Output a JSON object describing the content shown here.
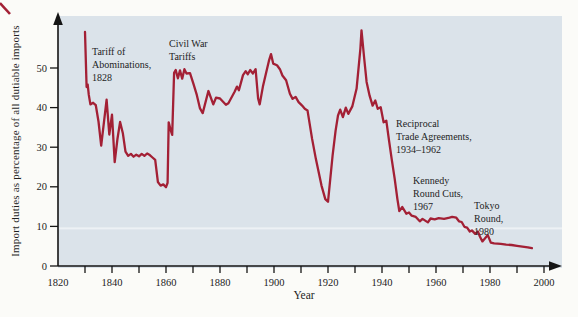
{
  "figure": {
    "x_axis_title": "Year",
    "y_axis_title": "Import duties as percentage of all dutiable imports"
  },
  "chart_data": {
    "type": "line",
    "title": "",
    "xlabel": "Year",
    "ylabel": "Import duties as percentage of all dutiable imports",
    "x_range": [
      1820,
      2010
    ],
    "y_range": [
      0,
      62
    ],
    "grid": "off",
    "x_tick_labels": [
      "1820",
      "1840",
      "1860",
      "1880",
      "1900",
      "1920",
      "1940",
      "1960",
      "1980",
      "2000"
    ],
    "x_tick_years": [
      1820,
      1840,
      1860,
      1880,
      1900,
      1920,
      1940,
      1960,
      1980,
      2000
    ],
    "x_minor_tick_years": [
      1830,
      1840,
      1850,
      1860,
      1870,
      1880,
      1890,
      1900,
      1910,
      1920,
      1930,
      1940,
      1950,
      1960,
      1970,
      1980,
      1990,
      2000
    ],
    "y_tick_labels": [
      "0",
      "10",
      "20",
      "30",
      "40",
      "50"
    ],
    "y_tick_values": [
      0,
      10,
      20,
      30,
      40,
      50
    ],
    "line_color": "#a32035",
    "plot_bg": "#dbe3ea",
    "axis_color": "#151515",
    "faint_stripe_value": 9.5,
    "series": [
      {
        "name": "Import duties as percentage of all dutiable imports",
        "points": [
          [
            1830,
            59.1
          ],
          [
            1830.6,
            45.2
          ],
          [
            1831,
            45.8
          ],
          [
            1831.4,
            43.2
          ],
          [
            1832,
            40.8
          ],
          [
            1833,
            41.2
          ],
          [
            1834,
            40.6
          ],
          [
            1835,
            36.5
          ],
          [
            1836,
            30.4
          ],
          [
            1837,
            36.2
          ],
          [
            1838,
            42.0
          ],
          [
            1839,
            33.2
          ],
          [
            1840,
            38.2
          ],
          [
            1841,
            26.2
          ],
          [
            1842,
            32.0
          ],
          [
            1843,
            36.4
          ],
          [
            1844,
            33.6
          ],
          [
            1845,
            28.9
          ],
          [
            1846,
            27.8
          ],
          [
            1847,
            28.3
          ],
          [
            1848,
            27.6
          ],
          [
            1849,
            28.1
          ],
          [
            1850,
            27.7
          ],
          [
            1851,
            28.3
          ],
          [
            1852,
            27.8
          ],
          [
            1853,
            28.4
          ],
          [
            1854,
            28.0
          ],
          [
            1855,
            27.4
          ],
          [
            1856,
            26.8
          ],
          [
            1857,
            21.2
          ],
          [
            1858,
            20.3
          ],
          [
            1859,
            20.6
          ],
          [
            1860,
            19.9
          ],
          [
            1860.6,
            21.0
          ],
          [
            1861,
            36.3
          ],
          [
            1861.8,
            34.1
          ],
          [
            1862.3,
            33.1
          ],
          [
            1863,
            48.8
          ],
          [
            1863.6,
            49.5
          ],
          [
            1864.4,
            47.4
          ],
          [
            1865.2,
            49.4
          ],
          [
            1866,
            47.3
          ],
          [
            1866.8,
            49.7
          ],
          [
            1867.6,
            48.6
          ],
          [
            1868.9,
            48.7
          ],
          [
            1870.1,
            46.1
          ],
          [
            1871.4,
            43.2
          ],
          [
            1872.6,
            39.8
          ],
          [
            1873.6,
            38.6
          ],
          [
            1875.7,
            44.2
          ],
          [
            1877.5,
            40.8
          ],
          [
            1878.5,
            42.5
          ],
          [
            1880,
            42.3
          ],
          [
            1882.2,
            40.7
          ],
          [
            1883.1,
            41.1
          ],
          [
            1885.4,
            44.0
          ],
          [
            1886.3,
            45.3
          ],
          [
            1887,
            44.4
          ],
          [
            1888.5,
            48.2
          ],
          [
            1889.5,
            49.2
          ],
          [
            1890.3,
            48.4
          ],
          [
            1891.2,
            49.5
          ],
          [
            1892.2,
            48.6
          ],
          [
            1893.2,
            49.7
          ],
          [
            1894.1,
            42.3
          ],
          [
            1894.7,
            40.8
          ],
          [
            1895.9,
            45.3
          ],
          [
            1896.9,
            48.2
          ],
          [
            1898.1,
            51.8
          ],
          [
            1898.9,
            53.5
          ],
          [
            1899.7,
            51.1
          ],
          [
            1901.1,
            50.7
          ],
          [
            1902.2,
            49.7
          ],
          [
            1903.1,
            48.1
          ],
          [
            1904.5,
            46.9
          ],
          [
            1905.9,
            43.5
          ],
          [
            1906.9,
            42.2
          ],
          [
            1908,
            42.7
          ],
          [
            1909.1,
            41.4
          ],
          [
            1910.4,
            40.5
          ],
          [
            1911.4,
            39.7
          ],
          [
            1912.4,
            39.3
          ],
          [
            1914.1,
            32.1
          ],
          [
            1915.5,
            27.0
          ],
          [
            1917.6,
            20.3
          ],
          [
            1919,
            16.9
          ],
          [
            1920,
            16.2
          ],
          [
            1921.7,
            27.9
          ],
          [
            1922.8,
            34.2
          ],
          [
            1923.7,
            38.0
          ],
          [
            1924.5,
            39.5
          ],
          [
            1925.5,
            37.6
          ],
          [
            1926.6,
            40.0
          ],
          [
            1927.5,
            38.4
          ],
          [
            1929,
            40.3
          ],
          [
            1930.6,
            44.8
          ],
          [
            1932,
            54.9
          ],
          [
            1932.4,
            59.5
          ],
          [
            1933.4,
            52.4
          ],
          [
            1934.3,
            46.5
          ],
          [
            1935.4,
            43.0
          ],
          [
            1936.5,
            40.5
          ],
          [
            1937.5,
            41.8
          ],
          [
            1938.4,
            39.7
          ],
          [
            1939.5,
            40.1
          ],
          [
            1940.6,
            36.3
          ],
          [
            1941.6,
            36.7
          ],
          [
            1942.5,
            32.1
          ],
          [
            1943.6,
            27.0
          ],
          [
            1944.7,
            22.0
          ],
          [
            1945.7,
            16.9
          ],
          [
            1946.4,
            13.9
          ],
          [
            1947.5,
            14.9
          ],
          [
            1949,
            13.2
          ],
          [
            1950,
            13.5
          ],
          [
            1951,
            12.7
          ],
          [
            1952.5,
            12.4
          ],
          [
            1954,
            11.3
          ],
          [
            1955,
            11.9
          ],
          [
            1957,
            11.0
          ],
          [
            1958,
            12.0
          ],
          [
            1959.5,
            11.8
          ],
          [
            1961,
            12.1
          ],
          [
            1963,
            11.9
          ],
          [
            1965,
            12.2
          ],
          [
            1966,
            12.4
          ],
          [
            1967.5,
            12.2
          ],
          [
            1968.5,
            11.3
          ],
          [
            1969.5,
            11.1
          ],
          [
            1970.5,
            9.9
          ],
          [
            1971.5,
            9.7
          ],
          [
            1972.5,
            8.7
          ],
          [
            1973.3,
            9.0
          ],
          [
            1974.5,
            8.1
          ],
          [
            1975.5,
            8.7
          ],
          [
            1976.3,
            7.4
          ],
          [
            1977.2,
            6.2
          ],
          [
            1978.2,
            7.0
          ],
          [
            1979.2,
            7.8
          ],
          [
            1980.3,
            5.9
          ],
          [
            1981.5,
            5.7
          ],
          [
            1984,
            5.6
          ],
          [
            1986,
            5.4
          ],
          [
            1988,
            5.3
          ],
          [
            1990,
            5.1
          ],
          [
            1992,
            4.9
          ],
          [
            1994,
            4.7
          ],
          [
            1995.5,
            4.5
          ]
        ]
      }
    ],
    "annotations": [
      {
        "id": "tariff-of-abominations",
        "lines": [
          "Tariff of",
          "Abominations,",
          "1828"
        ],
        "x_year": 1832.6,
        "y_value": 55.8
      },
      {
        "id": "civil-war-tariffs",
        "lines": [
          "Civil War",
          "Tariffs"
        ],
        "x_year": 1861.1,
        "y_value": 57.8
      },
      {
        "id": "reciprocal-trade",
        "lines": [
          "Reciprocal",
          "Trade Agreements,",
          "1934–1962"
        ],
        "x_year": 1945.2,
        "y_value": 37.6
      },
      {
        "id": "kennedy-round",
        "lines": [
          "Kennedy",
          "Round Cuts,",
          "1967"
        ],
        "x_year": 1951.5,
        "y_value": 23.2
      },
      {
        "id": "tokyo-round",
        "lines": [
          "Tokyo",
          "Round,",
          "1980"
        ],
        "x_year": 1974.1,
        "y_value": 16.9
      }
    ]
  }
}
